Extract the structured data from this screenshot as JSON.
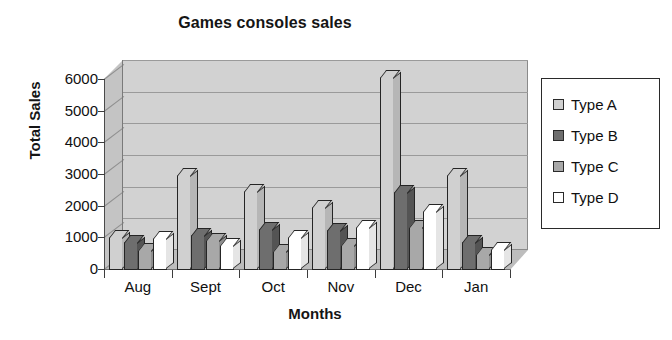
{
  "chart_data": {
    "type": "bar",
    "title": "Games consoles sales",
    "xlabel": "Months",
    "ylabel": "Total Sales",
    "categories": [
      "Aug",
      "Sept",
      "Oct",
      "Nov",
      "Dec",
      "Jan"
    ],
    "ylim": [
      0,
      6000
    ],
    "yticks": [
      0,
      1000,
      2000,
      3000,
      4000,
      5000,
      6000
    ],
    "ytick_labels": [
      "0",
      "1000",
      "2000",
      "3000",
      "4000",
      "5000",
      "6000"
    ],
    "grid": true,
    "legend_position": "right",
    "style": "3d-column-grayscale",
    "series": [
      {
        "name": "Type A",
        "color": "#d0d0d0",
        "values": [
          1050,
          3000,
          2500,
          2000,
          6100,
          3000
        ]
      },
      {
        "name": "Type B",
        "color": "#6e6e6e",
        "values": [
          900,
          1100,
          1300,
          1250,
          2450,
          900
        ]
      },
      {
        "name": "Type C",
        "color": "#a8a8a8",
        "values": [
          620,
          950,
          600,
          800,
          1350,
          520
        ]
      },
      {
        "name": "Type D",
        "color": "#ffffff",
        "values": [
          1000,
          800,
          1050,
          1350,
          1850,
          650
        ]
      }
    ]
  },
  "legend": {
    "items": [
      {
        "label": "Type A"
      },
      {
        "label": "Type B"
      },
      {
        "label": "Type C"
      },
      {
        "label": "Type D"
      }
    ]
  }
}
